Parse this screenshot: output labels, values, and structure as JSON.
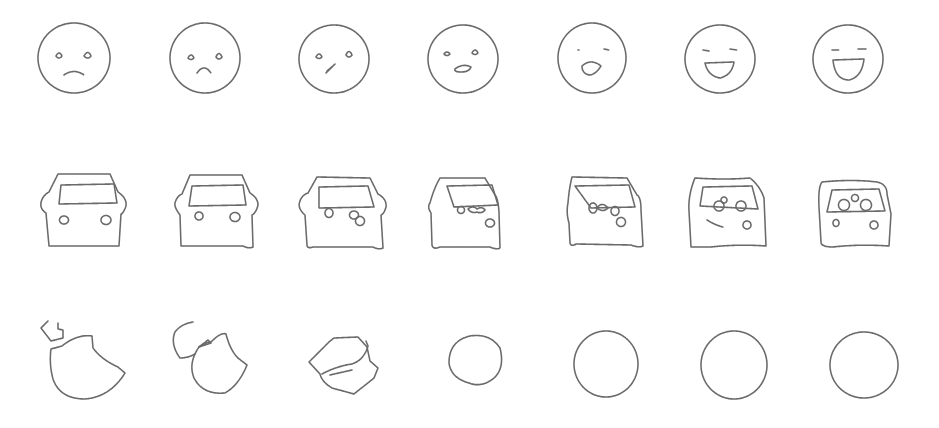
{
  "figure": {
    "stroke_color": "#6a6a6a",
    "background": "#ffffff",
    "rows": [
      {
        "name": "faces",
        "frames": [
          "sad face",
          "frown face",
          "neutral face with slanted mouth",
          "face with small open mouth",
          "face with open mouth and closed eyes",
          "smiling face with closed eyes",
          "laughing face with closed eyes"
        ]
      },
      {
        "name": "cars",
        "frames": [
          "car front view",
          "car front view",
          "car with overlapping lights",
          "car with lights inside window",
          "car with lights under window",
          "car with lights in window",
          "car with three circles in window"
        ]
      },
      {
        "name": "circles",
        "frames": [
          "bitten apple with leaf",
          "bitten shape with stem",
          "overlapping polygon and shape",
          "irregular circle",
          "circle",
          "circle",
          "circle"
        ]
      }
    ]
  }
}
